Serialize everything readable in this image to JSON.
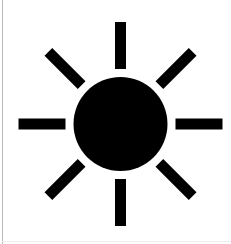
{
  "canvas": {
    "width": 231,
    "height": 244,
    "background_color": "#ffffff",
    "left_border_color": "#b9babc",
    "bottom_border_color": "#eceded"
  },
  "icon": {
    "name": "sun-icon",
    "label": "Sun",
    "fill_color": "#000000",
    "center": {
      "x": 120.5,
      "y": 124
    },
    "core": {
      "shape": "circle",
      "center_x": 120.5,
      "center_y": 124,
      "radius": 47
    },
    "rays": {
      "count": 8,
      "thickness": 11,
      "inner_radius": 55,
      "outer_radius": 102,
      "angles_deg": [
        0,
        45,
        90,
        135,
        180,
        225,
        270,
        315
      ],
      "items": [
        {
          "name": "ray-top",
          "angle_deg": 90
        },
        {
          "name": "ray-top-right",
          "angle_deg": 45
        },
        {
          "name": "ray-right",
          "angle_deg": 0
        },
        {
          "name": "ray-bottom-right",
          "angle_deg": 315
        },
        {
          "name": "ray-bottom",
          "angle_deg": 270
        },
        {
          "name": "ray-bottom-left",
          "angle_deg": 225
        },
        {
          "name": "ray-left",
          "angle_deg": 180
        },
        {
          "name": "ray-top-left",
          "angle_deg": 135
        }
      ]
    }
  }
}
